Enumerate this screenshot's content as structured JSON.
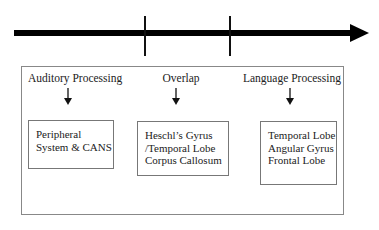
{
  "timeline": {
    "ticks": 2
  },
  "columns": [
    {
      "heading": "Auditory Processing",
      "box_lines": [
        "Peripheral",
        "System & CANS"
      ]
    },
    {
      "heading": "Overlap",
      "box_lines": [
        "Heschl’s Gyrus",
        "/Temporal Lobe",
        "Corpus Callosum"
      ]
    },
    {
      "heading": "Language Processing",
      "box_lines": [
        "Temporal Lobe",
        "Angular Gyrus",
        "Frontal Lobe"
      ]
    }
  ]
}
